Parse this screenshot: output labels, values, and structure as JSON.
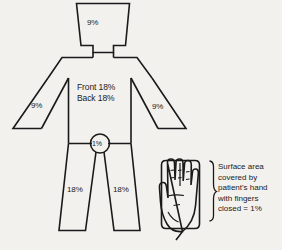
{
  "diagram": {
    "line_color": "#1a1a1a",
    "background_color": "#f3f1ee",
    "body_regions": {
      "head": {
        "label": "9%",
        "name": "head-and-neck"
      },
      "arm_left": {
        "label": "9%",
        "name": "left-arm"
      },
      "arm_right": {
        "label": "9%",
        "name": "right-arm"
      },
      "torso": {
        "front_label": "Front 18%",
        "back_label": "Back  18%",
        "name": "trunk"
      },
      "groin": {
        "label": "1%",
        "name": "perineum"
      },
      "leg_left": {
        "label": "18%",
        "name": "left-leg"
      },
      "leg_right": {
        "label": "18%",
        "name": "right-leg"
      }
    },
    "hand_note": {
      "line1": "Surface area",
      "line2": "covered by",
      "line3": "patient's hand",
      "line4": "with fingers",
      "line5": "closed = 1%"
    }
  }
}
